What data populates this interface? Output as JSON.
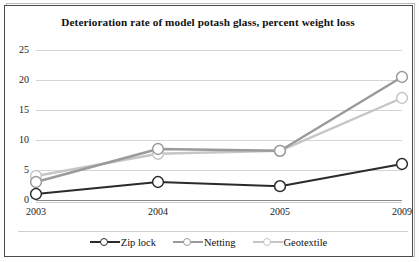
{
  "chart_data": {
    "type": "line",
    "title": "Deterioration rate of model potash glass, percent weight loss",
    "title_line1": "Deterioration rate of model potash glass, percent",
    "title_line2": "weight loss",
    "xlabel": "",
    "ylabel": "",
    "categories": [
      "2003",
      "2004",
      "2005",
      "2009"
    ],
    "ylim": [
      0,
      25
    ],
    "yticks": [
      0,
      5,
      10,
      15,
      20,
      25
    ],
    "ytick_labels": [
      "0",
      "5",
      "10",
      "15",
      "20",
      "25"
    ],
    "grid": true,
    "grid_axis": "y",
    "legend_position": "bottom",
    "marker": "open-circle",
    "series": [
      {
        "name": "Zip lock",
        "color": "#2b2b2b",
        "values": [
          1.0,
          3.0,
          2.3,
          6.0
        ]
      },
      {
        "name": "Netting",
        "color": "#9a9a9a",
        "values": [
          3.0,
          8.5,
          8.2,
          20.5
        ]
      },
      {
        "name": "Geotextile",
        "color": "#c6c6c6",
        "values": [
          4.0,
          7.7,
          8.2,
          17.0
        ]
      }
    ]
  },
  "colors": {
    "border": "#4a4a4a",
    "gridline": "#d5d5d5",
    "axis": "#8a8a8a",
    "text": "#111111",
    "background": "#ffffff"
  }
}
